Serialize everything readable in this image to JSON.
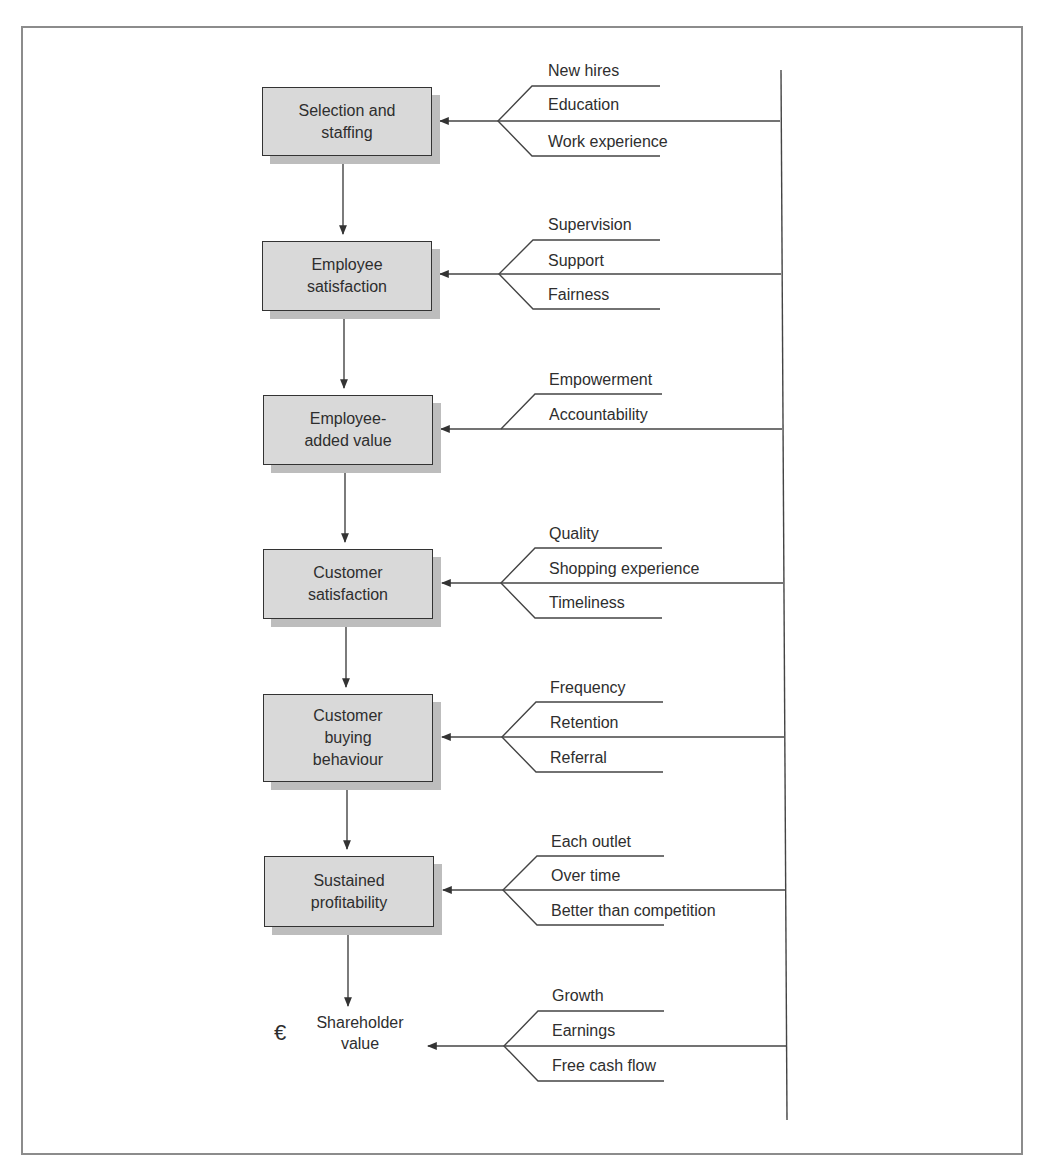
{
  "diagram": {
    "title": "",
    "stages": [
      {
        "id": "selection",
        "label_lines": [
          "Selection and",
          "staffing"
        ],
        "drivers": [
          "New hires",
          "Education",
          "Work experience"
        ]
      },
      {
        "id": "employee-satisfaction",
        "label_lines": [
          "Employee",
          "satisfaction"
        ],
        "drivers": [
          "Supervision",
          "Support",
          "Fairness"
        ]
      },
      {
        "id": "employee-added-value",
        "label_lines": [
          "Employee-",
          "added value"
        ],
        "drivers": [
          "Empowerment",
          "Accountability"
        ]
      },
      {
        "id": "customer-satisfaction",
        "label_lines": [
          "Customer",
          "satisfaction"
        ],
        "drivers": [
          "Quality",
          "Shopping experience",
          "Timeliness"
        ]
      },
      {
        "id": "customer-buying-behaviour",
        "label_lines": [
          "Customer",
          "buying",
          "behaviour"
        ],
        "drivers": [
          "Frequency",
          "Retention",
          "Referral"
        ]
      },
      {
        "id": "sustained-profitability",
        "label_lines": [
          "Sustained",
          "profitability"
        ],
        "drivers": [
          "Each outlet",
          "Over time",
          "Better than competition"
        ]
      }
    ],
    "terminal": {
      "icon": "€",
      "label_lines": [
        "Shareholder",
        "value"
      ],
      "drivers": [
        "Growth",
        "Earnings",
        "Free cash flow"
      ]
    },
    "colors": {
      "box_fill": "#d9d9d9",
      "box_shadow": "#bdbdbd",
      "line": "#444444",
      "frame": "#8c8c8c"
    }
  }
}
